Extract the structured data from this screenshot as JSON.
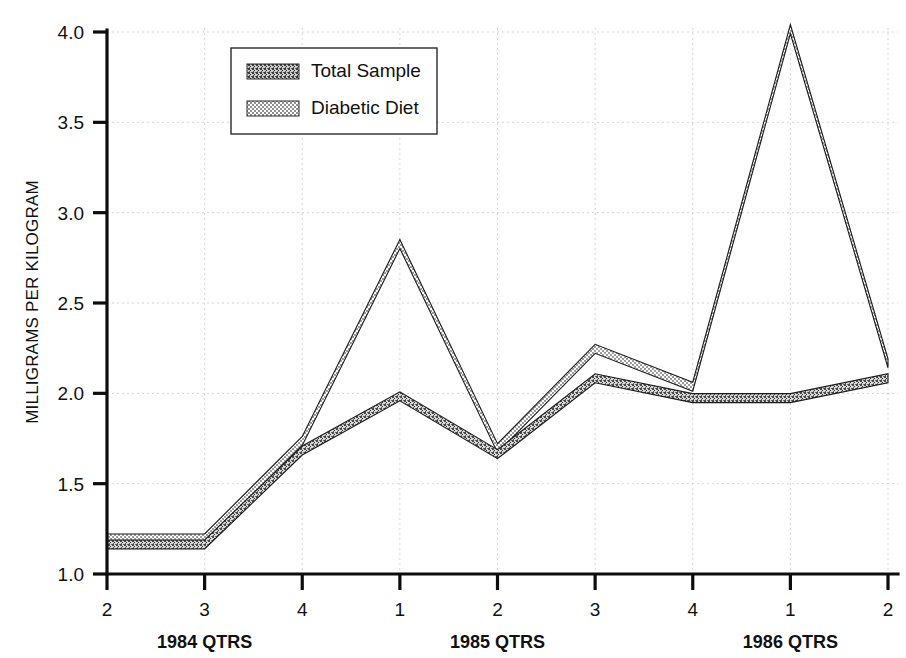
{
  "chart_data": {
    "type": "line",
    "title": "",
    "xlabel": "",
    "ylabel": "MILLIGRAMS PER KILOGRAM",
    "ylim": [
      1.0,
      4.0
    ],
    "ytick_labels": [
      "1.0",
      "1.5",
      "2.0",
      "2.5",
      "3.0",
      "3.5",
      "4.0"
    ],
    "ytick_values": [
      1.0,
      1.5,
      2.0,
      2.5,
      3.0,
      3.5,
      4.0
    ],
    "grid": true,
    "grid_style": "dotted-light",
    "legend_position": "top-center",
    "categories": [
      "2",
      "3",
      "4",
      "1",
      "2",
      "3",
      "4",
      "1",
      "2"
    ],
    "xtick_labels": [
      "2",
      "3",
      "4",
      "1",
      "2",
      "3",
      "4",
      "1",
      "2"
    ],
    "x_group_labels": [
      {
        "label": "1984 QTRS",
        "center_category_index": 1
      },
      {
        "label": "1985 QTRS",
        "center_category_index": 4
      },
      {
        "label": "1986 QTRS",
        "center_category_index": 7
      }
    ],
    "series": [
      {
        "name": "Total Sample",
        "pattern": "dark-speckle",
        "values": [
          1.18,
          1.18,
          1.7,
          2.0,
          1.68,
          2.1,
          1.99,
          1.99,
          2.1
        ]
      },
      {
        "name": "Diabetic Diet",
        "pattern": "light-checker",
        "values": [
          1.18,
          1.18,
          1.72,
          2.81,
          1.68,
          2.23,
          2.02,
          4.0,
          2.15
        ]
      }
    ]
  },
  "legend": {
    "entries": [
      {
        "label": "Total Sample",
        "swatch": "dark-speckle-swatch"
      },
      {
        "label": "Diabetic Diet",
        "swatch": "light-checker-swatch"
      }
    ]
  },
  "axes": {
    "y_axis_title": "MILLIGRAMS PER KILOGRAM"
  },
  "colors": {
    "axis": "#0d0d0d",
    "grid": "#c9c9c9",
    "series_total_sample": "#6e6e6e",
    "series_diabetic_diet": "#a8a8a8",
    "background": "#ffffff",
    "text": "#111111"
  }
}
